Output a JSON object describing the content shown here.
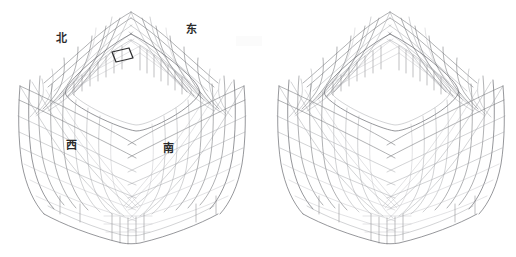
{
  "figure": {
    "title": "",
    "background_color": "#ffffff",
    "line_color": "#6f7176",
    "highlight_color": "#2e2e30",
    "label_color": "#2b2b2b"
  },
  "views": [
    {
      "id": "left-view",
      "name": "annotated-view",
      "has_direction_labels": true,
      "has_highlight_panel": true,
      "center_x": 131,
      "center_y": 126
    },
    {
      "id": "right-view",
      "name": "plain-view",
      "has_direction_labels": false,
      "has_highlight_panel": false,
      "center_x": 390,
      "center_y": 126
    }
  ],
  "labels": {
    "north": "北",
    "east": "东",
    "west": "西",
    "south": "南"
  },
  "highlight": {
    "name": "highlighted-panel",
    "points": "112,52 129,48 133,58 116,62"
  }
}
